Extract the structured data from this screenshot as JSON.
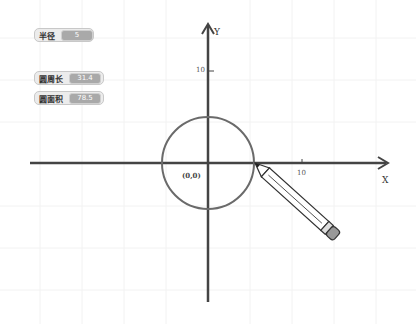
{
  "monitors": [
    {
      "label": "半径",
      "value": "5"
    },
    {
      "label": "圆周长",
      "value": "31.4"
    },
    {
      "label": "圆面积",
      "value": "78.5"
    }
  ],
  "axes": {
    "x_label": "X",
    "y_label": "Y",
    "x_tick": "10",
    "y_tick": "10",
    "origin": "(0,0)"
  },
  "colors": {
    "axis": "#444444",
    "circle": "#666666",
    "monitor_bg": "#ececec",
    "value_bg": "#a9a9a9"
  },
  "sprite": {
    "name": "pencil-sprite"
  }
}
